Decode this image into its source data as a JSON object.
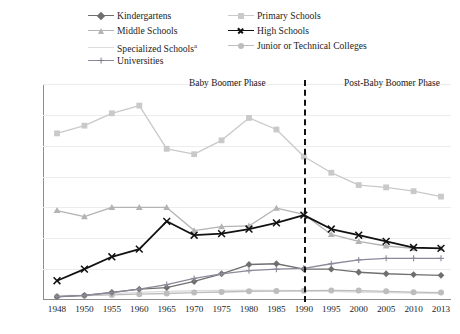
{
  "legend": {
    "items": [
      {
        "label": "Kindergartens",
        "key": "kindergartens",
        "color": "#6f6f6f",
        "marker": "diamond",
        "col": 0,
        "row": 0
      },
      {
        "label": "Primary Schools",
        "key": "primary",
        "color": "#c9c9c9",
        "marker": "square",
        "col": 1,
        "row": 0
      },
      {
        "label": "Middle Schools",
        "key": "middle",
        "color": "#b3b3b3",
        "marker": "triangle",
        "col": 0,
        "row": 1
      },
      {
        "label": "High Schools",
        "key": "high",
        "color": "#111111",
        "marker": "x",
        "col": 1,
        "row": 1
      },
      {
        "label": "Specialized Schools",
        "sup": "a",
        "key": "specialized",
        "color": "#dcdcdc",
        "marker": "none",
        "col": 0,
        "row": 2
      },
      {
        "label": "Junior or Technical Colleges",
        "key": "junior",
        "color": "#bdbdbd",
        "marker": "circle",
        "col": 1,
        "row": 2
      },
      {
        "label": "Universities",
        "key": "universities",
        "color": "#8a8a9a",
        "marker": "plus",
        "col": 0,
        "row": 3
      }
    ]
  },
  "annotations": {
    "baby_boomer": "Baby Boomer Phase",
    "post_baby_boomer": "Post-Baby Boomer Phase",
    "divider_year": "1990"
  },
  "chart_data": {
    "type": "line",
    "title": "",
    "xlabel": "",
    "ylabel": "",
    "ylim": [
      0,
      14000
    ],
    "ytick_step": 2000,
    "yticks": [
      0,
      2000,
      4000,
      6000,
      8000,
      10000,
      12000,
      14000
    ],
    "grid": true,
    "legend_position": "top",
    "categories": [
      "1948",
      "1950",
      "1955",
      "1960",
      "1965",
      "1970",
      "1975",
      "1980",
      "1985",
      "1990",
      "1995",
      "2000",
      "2005",
      "2010",
      "2013"
    ],
    "series": [
      {
        "name": "Kindergartens",
        "color": "#6f6f6f",
        "marker": "diamond",
        "values": [
          200,
          300,
          500,
          700,
          800,
          1200,
          1700,
          2300,
          2350,
          2000,
          2000,
          1800,
          1700,
          1650,
          1600
        ]
      },
      {
        "name": "Primary Schools",
        "color": "#c9c9c9",
        "marker": "square",
        "values": [
          10800,
          11300,
          12100,
          12600,
          9800,
          9450,
          10350,
          11800,
          11050,
          9300,
          8250,
          7450,
          7300,
          7050,
          6700
        ]
      },
      {
        "name": "Middle Schools",
        "color": "#b3b3b3",
        "marker": "triangle",
        "values": [
          5800,
          5400,
          6000,
          6000,
          6000,
          4500,
          4750,
          4800,
          5950,
          5550,
          4250,
          3800,
          3500,
          3350,
          3350
        ]
      },
      {
        "name": "High Schools",
        "color": "#111111",
        "marker": "x",
        "values": [
          1250,
          2000,
          2800,
          3300,
          5100,
          4200,
          4300,
          4600,
          5000,
          5500,
          4600,
          4200,
          3800,
          3400,
          3350
        ]
      },
      {
        "name": "Specialized Schools",
        "color": "#dcdcdc",
        "marker": "none",
        "values": [
          280,
          320,
          400,
          500,
          560,
          600,
          620,
          640,
          620,
          600,
          560,
          520,
          480,
          440,
          420
        ]
      },
      {
        "name": "Junior or Technical Colleges",
        "color": "#bdbdbd",
        "marker": "circle",
        "values": [
          230,
          280,
          330,
          380,
          420,
          480,
          520,
          560,
          580,
          600,
          620,
          610,
          560,
          510,
          480
        ]
      },
      {
        "name": "Universities",
        "color": "#8a8a9a",
        "marker": "plus",
        "values": [
          220,
          300,
          480,
          700,
          1000,
          1400,
          1700,
          1900,
          2000,
          2050,
          2350,
          2600,
          2700,
          2700,
          2700
        ]
      }
    ]
  }
}
